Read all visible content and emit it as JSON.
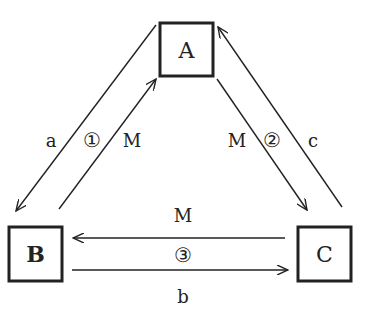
{
  "nodes": {
    "A": {
      "label": "A",
      "bold": false
    },
    "B": {
      "label": "B",
      "bold": true
    },
    "C": {
      "label": "C",
      "bold": false
    }
  },
  "edges": [
    {
      "id": "A-to-B",
      "from": "A",
      "to": "B",
      "label": "a"
    },
    {
      "id": "B-to-A",
      "from": "B",
      "to": "A",
      "label": "M"
    },
    {
      "id": "A-to-C",
      "from": "A",
      "to": "C",
      "label": "M"
    },
    {
      "id": "C-to-A",
      "from": "C",
      "to": "A",
      "label": "c"
    },
    {
      "id": "C-to-B",
      "from": "C",
      "to": "B",
      "label": "M"
    },
    {
      "id": "B-to-C",
      "from": "B",
      "to": "C",
      "label": "b"
    }
  ],
  "steps": {
    "step1": "①",
    "step2": "②",
    "step3": "③"
  },
  "colors": {
    "stroke": "#222222",
    "background": "#ffffff"
  }
}
